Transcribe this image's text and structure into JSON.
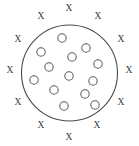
{
  "diagram": {
    "title": "",
    "background_color": "#ffffff",
    "boundary": {
      "label": "membrane-boundary",
      "shape": "circle",
      "cx": 69.5,
      "cy": 73,
      "r": 48,
      "stroke_color": "#4a4a4a",
      "stroke_width": 1.1,
      "fill": "none"
    },
    "inside_markers": {
      "glyph": "O",
      "semantic": "open-circle-particle",
      "count": 13,
      "radius": 4.2,
      "stroke_color": "#5a5a5a",
      "fill_color": "#ffffff",
      "points": [
        {
          "cx": 62,
          "cy": 38
        },
        {
          "cx": 41,
          "cy": 52
        },
        {
          "cx": 86,
          "cy": 48
        },
        {
          "cx": 72,
          "cy": 57
        },
        {
          "cx": 49,
          "cy": 67
        },
        {
          "cx": 98,
          "cy": 64
        },
        {
          "cx": 34,
          "cy": 80
        },
        {
          "cx": 69,
          "cy": 76
        },
        {
          "cx": 93,
          "cy": 81
        },
        {
          "cx": 54,
          "cy": 90
        },
        {
          "cx": 85,
          "cy": 94
        },
        {
          "cx": 64,
          "cy": 106
        },
        {
          "cx": 95,
          "cy": 105
        }
      ]
    },
    "outside_markers": {
      "glyph": "X",
      "semantic": "x-mark-particle",
      "count": 12,
      "color": "#3c3c3c",
      "font_size": 9.5,
      "points": [
        {
          "cx": 69,
          "cy": 8,
          "angle_deg": 270
        },
        {
          "cx": 41,
          "cy": 16,
          "angle_deg": 240
        },
        {
          "cx": 98,
          "cy": 16,
          "angle_deg": 300
        },
        {
          "cx": 18,
          "cy": 39,
          "angle_deg": 210
        },
        {
          "cx": 121,
          "cy": 39,
          "angle_deg": 330
        },
        {
          "cx": 10,
          "cy": 70,
          "angle_deg": 180
        },
        {
          "cx": 129,
          "cy": 70,
          "angle_deg": 0
        },
        {
          "cx": 18,
          "cy": 102,
          "angle_deg": 150
        },
        {
          "cx": 121,
          "cy": 102,
          "angle_deg": 30
        },
        {
          "cx": 41,
          "cy": 125,
          "angle_deg": 120
        },
        {
          "cx": 97,
          "cy": 125,
          "angle_deg": 60
        },
        {
          "cx": 69,
          "cy": 137,
          "angle_deg": 90
        }
      ]
    }
  }
}
